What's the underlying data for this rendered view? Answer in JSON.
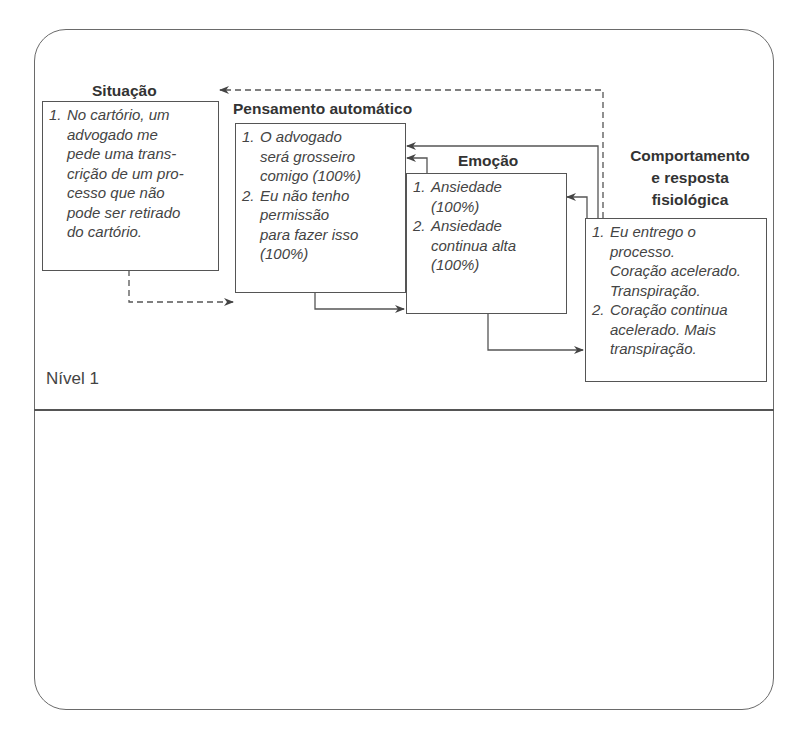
{
  "diagram": {
    "level_label": "Nível 1",
    "nodes": {
      "situacao": {
        "title": "Situação",
        "items": [
          {
            "num": "1.",
            "text": "No cartório, um\nadvogado me\npede uma trans-\ncrição de um pro-\ncesso que não\npode ser retirado\ndo cartório."
          }
        ]
      },
      "pensamento": {
        "title": "Pensamento automático",
        "items": [
          {
            "num": "1.",
            "text": "O advogado\nserá grosseiro\ncomigo (100%)"
          },
          {
            "num": "2.",
            "text": "Eu não tenho\npermissão\npara fazer isso\n(100%)"
          }
        ]
      },
      "emocao": {
        "title": "Emoção",
        "items": [
          {
            "num": "1.",
            "text": "Ansiedade\n(100%)"
          },
          {
            "num": "2.",
            "text": "Ansiedade\ncontinua alta\n(100%)"
          }
        ]
      },
      "comportamento": {
        "title_lines": [
          "Comportamento",
          "e resposta",
          "fisiológica"
        ],
        "items": [
          {
            "num": "1.",
            "text": "Eu entrego o\nprocesso.\nCoração acelerado.\nTranspiração."
          },
          {
            "num": "2.",
            "text": "Coração continua\nacelerado. Mais\ntranspiração."
          }
        ]
      }
    },
    "connections": [
      {
        "from": "situacao",
        "to": "pensamento",
        "style": "dashed"
      },
      {
        "from": "pensamento",
        "to": "emocao",
        "style": "solid"
      },
      {
        "from": "emocao",
        "to": "comportamento",
        "style": "solid"
      },
      {
        "from": "emocao",
        "to": "pensamento",
        "style": "solid"
      },
      {
        "from": "comportamento",
        "to": "pensamento",
        "style": "solid"
      },
      {
        "from": "comportamento",
        "to": "emocao",
        "style": "solid"
      },
      {
        "from": "comportamento",
        "to": "situacao",
        "style": "dashed"
      }
    ],
    "colors": {
      "line": "#555555",
      "text": "#444444",
      "background": "#ffffff"
    }
  }
}
